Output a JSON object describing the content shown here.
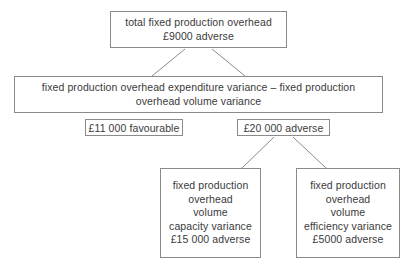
{
  "diagram": {
    "stroke_color": "#8a8a8a",
    "text_color": "#3a3a3a",
    "background": "#ffffff",
    "nodes": {
      "total": {
        "lines": [
          "total fixed production overhead",
          "£9000 adverse"
        ]
      },
      "formula": {
        "lines": [
          "fixed production overhead expenditure variance – fixed production",
          "overhead volume variance"
        ]
      },
      "capacity": {
        "lines": [
          "fixed production",
          "overhead",
          "volume",
          "capacity variance",
          "£15 000 adverse"
        ]
      },
      "efficiency": {
        "lines": [
          "fixed production",
          "overhead",
          "volume",
          "efficiency variance",
          "£5000 adverse"
        ]
      }
    },
    "badges": {
      "expenditure": "£11 000 favourable",
      "volume": "£20 000 adverse"
    }
  }
}
